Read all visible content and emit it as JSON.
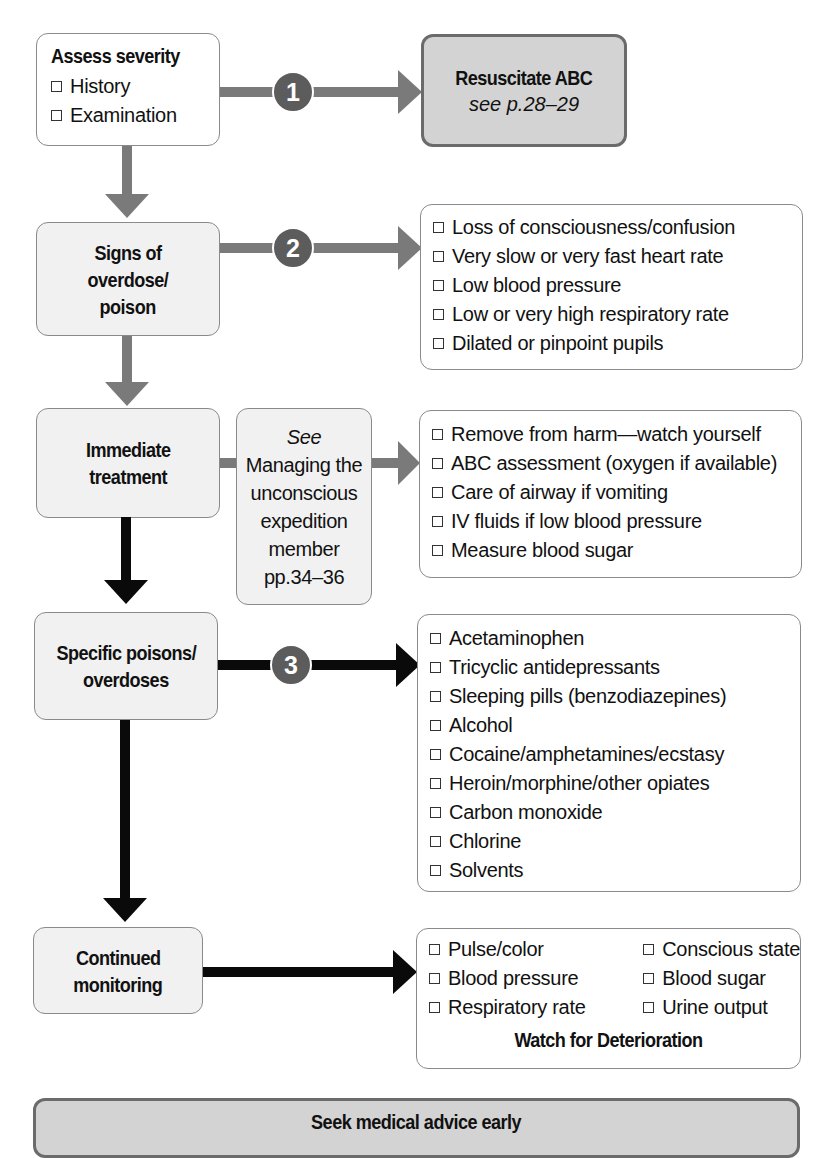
{
  "flowchart": {
    "steps": {
      "assess": {
        "title": "Assess severity",
        "items": [
          "History",
          "Examination"
        ]
      },
      "signs": {
        "title_lines": [
          "Signs of",
          "overdose/",
          "poison"
        ]
      },
      "immediate": {
        "title_lines": [
          "Immediate",
          "treatment"
        ]
      },
      "specific": {
        "title_lines": [
          "Specific poisons/",
          "overdoses"
        ]
      },
      "monitoring": {
        "title_lines": [
          "Continued",
          "monitoring"
        ]
      }
    },
    "resuscitate": {
      "title": "Resuscitate ABC",
      "ref": "see p.28–29"
    },
    "see_box": {
      "lines": [
        "See",
        "Managing the",
        "unconscious",
        "expedition",
        "member",
        "pp.34–36"
      ]
    },
    "signs_list": [
      "Loss of consciousness/confusion",
      "Very slow or very fast heart rate",
      "Low blood pressure",
      "Low or very high respiratory rate",
      "Dilated or pinpoint pupils"
    ],
    "treatment_list": [
      "Remove from harm—watch yourself",
      "ABC assessment (oxygen if available)",
      "Care of airway if vomiting",
      "IV fluids if low blood pressure",
      "Measure blood sugar"
    ],
    "poisons_list": [
      "Acetaminophen",
      "Tricyclic antidepressants",
      "Sleeping pills (benzodiazepines)",
      "Alcohol",
      "Cocaine/amphetamines/ecstasy",
      "Heroin/morphine/other opiates",
      "Carbon monoxide",
      "Chlorine",
      "Solvents"
    ],
    "monitoring_list": {
      "left": [
        "Pulse/color",
        "Blood pressure",
        "Respiratory rate"
      ],
      "right": [
        "Conscious state",
        "Blood sugar",
        "Urine output"
      ],
      "footer": "Watch for Deterioration"
    },
    "markers": [
      "1",
      "2",
      "3"
    ],
    "footer_banner": "Seek medical advice early"
  },
  "colors": {
    "gray_arrow": "#7a7a7a",
    "black_arrow": "#0a0a0a",
    "marker": "#5c5c5c",
    "highlight_box": "#d3d3d3",
    "light_box": "#f1f1f1"
  }
}
